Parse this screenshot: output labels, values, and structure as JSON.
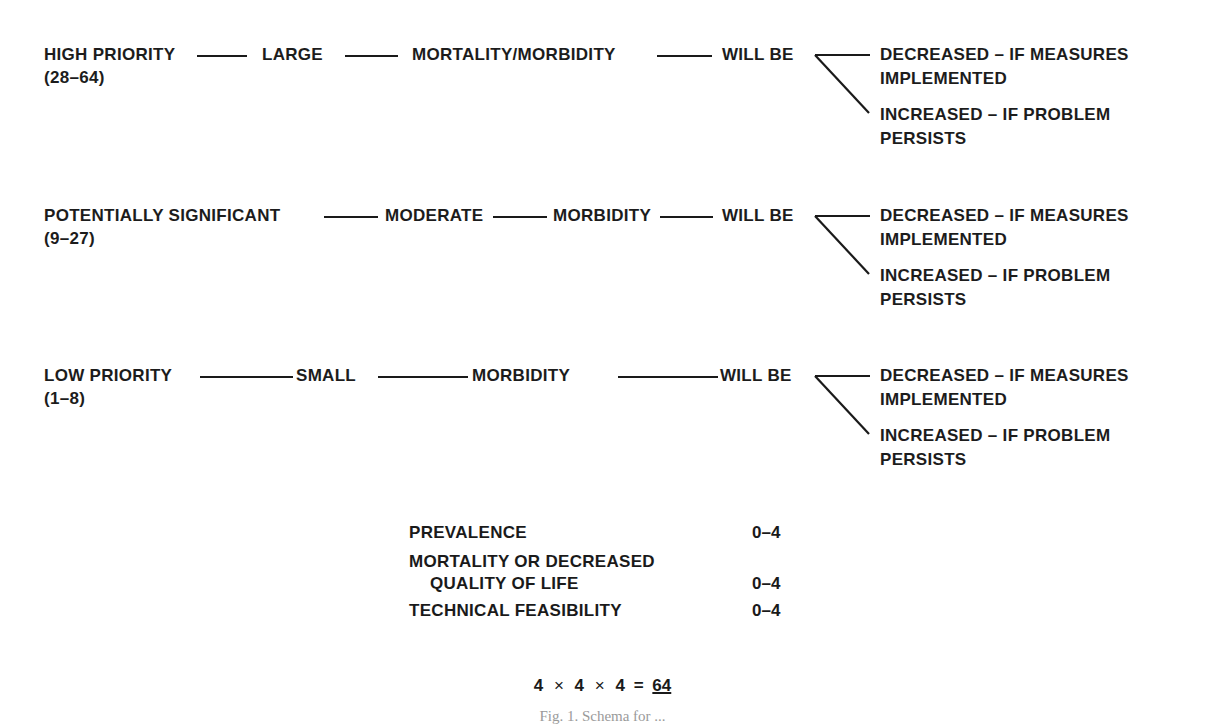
{
  "rows": [
    {
      "priority": "HIGH PRIORITY",
      "range": "(28–64)",
      "magnitude": "LARGE",
      "effect": "MORTALITY/MORBIDITY",
      "will_be": "WILL BE",
      "outcome_decreased": [
        "DECREASED – IF MEASURES",
        "IMPLEMENTED"
      ],
      "outcome_increased": [
        "INCREASED – IF PROBLEM",
        "PERSISTS"
      ]
    },
    {
      "priority": "POTENTIALLY SIGNIFICANT",
      "range": "(9–27)",
      "magnitude": "MODERATE",
      "effect": "MORBIDITY",
      "will_be": "WILL BE",
      "outcome_decreased": [
        "DECREASED – IF MEASURES",
        "IMPLEMENTED"
      ],
      "outcome_increased": [
        "INCREASED – IF PROBLEM",
        "PERSISTS"
      ]
    },
    {
      "priority": "LOW PRIORITY",
      "range": "(1–8)",
      "magnitude": "SMALL",
      "effect": "MORBIDITY",
      "will_be": "WILL BE",
      "outcome_decreased": [
        "DECREASED – IF MEASURES",
        "IMPLEMENTED"
      ],
      "outcome_increased": [
        "INCREASED – IF PROBLEM",
        "PERSISTS"
      ]
    }
  ],
  "scoring": [
    {
      "label": [
        "PREVALENCE"
      ],
      "value": "0–4"
    },
    {
      "label": [
        "MORTALITY OR DECREASED",
        "QUALITY OF LIFE"
      ],
      "value": "0–4"
    },
    {
      "label": [
        "TECHNICAL FEASIBILITY"
      ],
      "value": "0–4"
    }
  ],
  "formula": {
    "a": "4",
    "op1": "×",
    "b": "4",
    "op2": "×",
    "c": "4",
    "eq": "=",
    "result": "64"
  },
  "caption": "Fig. 1. Schema for ..."
}
